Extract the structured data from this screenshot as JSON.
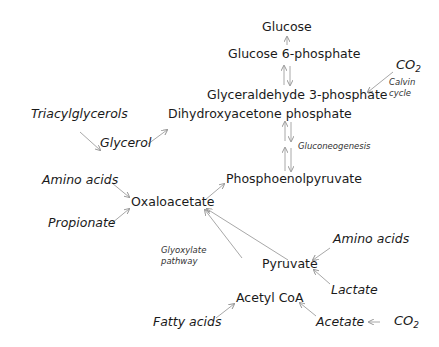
{
  "diagram": {
    "title": "",
    "nodes": {
      "glucose": "Glucose",
      "g6p": "Glucose 6-phosphate",
      "co2_top": "CO",
      "co2_top_sub": "2",
      "calvin_1": "Calvin",
      "calvin_2": "cycle",
      "gap": "Glyceraldehyde 3-phosphate",
      "triacyl": "Triacylglycerols",
      "glycerol": "Glycerol",
      "dhap": "Dihydroxyacetone phosphate",
      "gluconeo": "Gluconeogenesis",
      "pep": "Phosphoenolpyruvate",
      "amino1": "Amino acids",
      "oaa": "Oxaloacetate",
      "propionate": "Propionate",
      "glyox_1": "Glyoxylate",
      "glyox_2": "pathway",
      "amino2": "Amino acids",
      "pyruvate": "Pyruvate",
      "lactate": "Lactate",
      "acetylcoa": "Acetyl CoA",
      "fatty": "Fatty acids",
      "acetate": "Acetate",
      "co2_bottom": "CO",
      "co2_bottom_sub": "2"
    },
    "colors": {
      "text": "#1a1a1a",
      "arrow": "#a0a0a0"
    }
  }
}
